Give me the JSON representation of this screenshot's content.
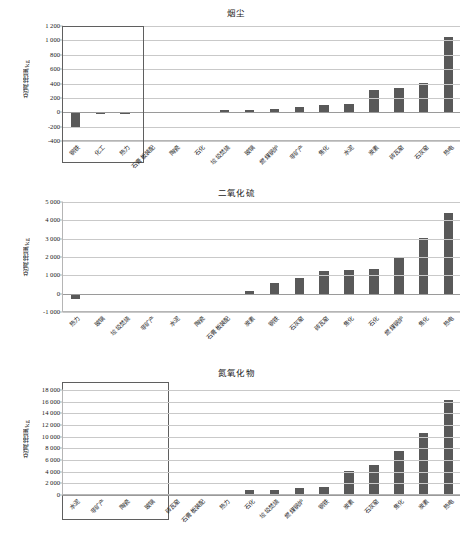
{
  "page": {
    "ylabel": "总减排量/kg"
  },
  "chart_data": [
    {
      "type": "bar",
      "title": "烟尘",
      "xlabel": "",
      "ylabel": "总减排量/kg",
      "ylim": [
        -400,
        1200
      ],
      "yticks": [
        -400,
        -200,
        0,
        200,
        400,
        600,
        800,
        1000,
        1200
      ],
      "ytick_labels": [
        "-400",
        "-200",
        "0",
        "200",
        "400",
        "600",
        "800",
        "1 000",
        "1 200"
      ],
      "grid": true,
      "legend": "none",
      "categories": [
        "钢铁",
        "化工",
        "热力",
        "石膏板装配",
        "陶瓷",
        "石化",
        "垃圾焚烧",
        "玻璃",
        "燃煤锅炉",
        "非矿产",
        "焦化",
        "水泥",
        "炭素",
        "砖瓦窑",
        "石灰窑",
        "热电"
      ],
      "values": [
        -225,
        -30,
        -28,
        0,
        0,
        8,
        27,
        33,
        50,
        72,
        105,
        120,
        308,
        340,
        412,
        1045
      ]
    },
    {
      "type": "bar",
      "title": "二氧化硫",
      "xlabel": "",
      "ylabel": "总减排量/kg",
      "ylim": [
        -1000,
        5000
      ],
      "yticks": [
        -1000,
        0,
        1000,
        2000,
        3000,
        4000,
        5000
      ],
      "ytick_labels": [
        "-1 000",
        "0",
        "1 000",
        "2 000",
        "3 000",
        "4 000",
        "5 000"
      ],
      "grid": true,
      "legend": "none",
      "categories": [
        "热力",
        "玻璃",
        "垃圾焚烧",
        "非矿产",
        "水泥",
        "陶瓷",
        "石膏板装配",
        "炭素",
        "钢铁",
        "石灰窑",
        "砖瓦窑",
        "焦化",
        "石化",
        "燃煤锅炉",
        "焦化",
        "热电"
      ],
      "values": [
        -285,
        -95,
        0,
        0,
        0,
        -40,
        -70,
        140,
        590,
        835,
        1255,
        1300,
        1365,
        1975,
        3060,
        4420
      ]
    },
    {
      "type": "bar",
      "title": "氮氧化物",
      "xlabel": "",
      "ylabel": "总减排量/kg",
      "ylim": [
        0,
        18000
      ],
      "yticks": [
        0,
        2000,
        4000,
        6000,
        8000,
        10000,
        12000,
        14000,
        16000,
        18000
      ],
      "ytick_labels": [
        "0",
        "2 000",
        "4 000",
        "6 000",
        "8 000",
        "10 000",
        "12 000",
        "14 000",
        "16 000",
        "18 000"
      ],
      "grid": true,
      "legend": "none",
      "categories": [
        "水泥",
        "非矿产",
        "陶瓷",
        "玻璃",
        "砖瓦窑",
        "石膏板装配",
        "热力",
        "石化",
        "垃圾焚烧",
        "燃煤锅炉",
        "钢铁",
        "炭素",
        "石灰窑",
        "焦化",
        "炭素",
        "热电"
      ],
      "values": [
        0,
        0,
        0,
        0,
        110,
        95,
        230,
        800,
        850,
        1150,
        1350,
        4200,
        5150,
        7550,
        10600,
        16300
      ]
    }
  ],
  "highlights": [
    {
      "chart": 0,
      "label": "negative-group-box-1"
    },
    {
      "chart": 1,
      "label": "negative-group-box-2"
    }
  ]
}
